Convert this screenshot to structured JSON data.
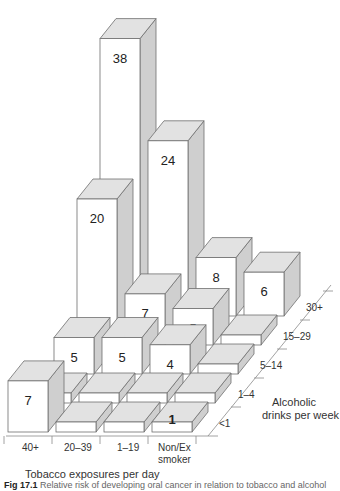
{
  "chart_data": {
    "type": "bar3d",
    "title": "",
    "xlabel": "Tobacco exposures per day",
    "ylabel": "Alcoholic drinks per week",
    "x_categories": [
      "40+",
      "20–39",
      "1–19",
      "Non/Ex smoker"
    ],
    "y_categories": [
      "<1",
      "1–4",
      "5–14",
      "15–29",
      "30+"
    ],
    "series": [
      {
        "name": "<1",
        "values": [
          7,
          null,
          null,
          1
        ]
      },
      {
        "name": "1–4",
        "values": [
          null,
          null,
          null,
          null
        ]
      },
      {
        "name": "5–14",
        "values": [
          5,
          5,
          4,
          null
        ]
      },
      {
        "name": "15–29",
        "values": [
          20,
          7,
          5,
          null
        ]
      },
      {
        "name": "30+",
        "values": [
          38,
          24,
          8,
          6
        ]
      }
    ],
    "flat_bar_note": "unlabeled cells drawn as short flat slabs (values ~1-2, not labeled)",
    "grid": false,
    "legend": "none"
  },
  "axes": {
    "x_title": "Tobacco exposures per day",
    "x_ticks": [
      "40+",
      "20–39",
      "1–19",
      "Non/Ex",
      "smoker"
    ],
    "y_title_line1": "Alcoholic",
    "y_title_line2": "drinks per week",
    "y_ticks": [
      "<1",
      "1–4",
      "5–14",
      "15–29",
      "30+"
    ]
  },
  "caption": {
    "prefix": "Fig 17.1",
    "text": "Relative risk of developing oral cancer in relation to tobacco and alcohol"
  }
}
